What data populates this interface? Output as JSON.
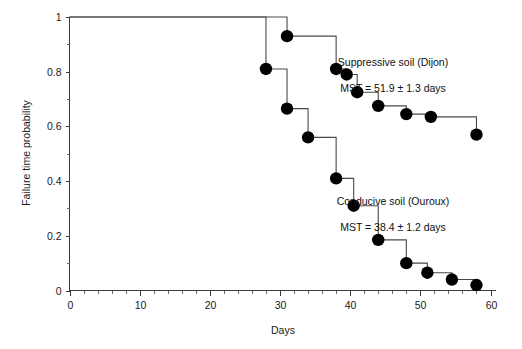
{
  "chart_data": {
    "type": "line",
    "title": "",
    "xlabel": "Days",
    "ylabel": "Failure time probability",
    "xlim": [
      0,
      60
    ],
    "ylim": [
      0,
      1
    ],
    "grid": false,
    "legend_position": "inside-right-annotations",
    "x_ticks": [
      0,
      10,
      20,
      30,
      40,
      50,
      60
    ],
    "x_tick_labels": [
      "0",
      "10",
      "20",
      "30",
      "40",
      "50",
      "60"
    ],
    "x_minor_step": 2,
    "y_ticks": [
      0,
      0.2,
      0.4,
      0.6,
      0.8,
      1
    ],
    "y_tick_labels": [
      "0",
      "0.2",
      "0.4",
      "0.6",
      "0.8",
      "1"
    ],
    "y_minor_ticks": [
      0.1,
      0.3,
      0.5,
      0.7,
      0.9
    ],
    "series": [
      {
        "name": "Suppressive soil (Dijon)",
        "style": "step",
        "marker": "filled-circle",
        "x": [
          0,
          31,
          38,
          39.5,
          41,
          44,
          48,
          51.5,
          58
        ],
        "y": [
          1,
          0.93,
          0.81,
          0.79,
          0.725,
          0.675,
          0.645,
          0.635,
          0.57
        ],
        "marker_x": [
          31,
          38,
          39.5,
          41,
          44,
          48,
          51.5,
          58
        ],
        "marker_y": [
          0.93,
          0.81,
          0.79,
          0.725,
          0.675,
          0.645,
          0.635,
          0.57
        ]
      },
      {
        "name": "Conducive soil (Ouroux)",
        "style": "step",
        "marker": "filled-circle",
        "x": [
          0,
          28,
          31,
          34,
          38,
          40.5,
          44,
          48,
          51,
          54.5,
          58
        ],
        "y": [
          1,
          0.81,
          0.665,
          0.56,
          0.41,
          0.31,
          0.185,
          0.1,
          0.065,
          0.04,
          0.02
        ],
        "marker_x": [
          28,
          31,
          34,
          38,
          40.5,
          44,
          48,
          51,
          54.5,
          58
        ],
        "marker_y": [
          0.81,
          0.665,
          0.56,
          0.41,
          0.31,
          0.185,
          0.1,
          0.065,
          0.04,
          0.02
        ]
      }
    ],
    "annotations": [
      {
        "id": "suppressive",
        "line1": "Suppressive soil (Dijon)",
        "line2": "MST = 51.9 ± 1.3 days",
        "mst_value": 51.9,
        "mst_error": 1.3,
        "mst_units": "days"
      },
      {
        "id": "conducive",
        "line1": "Conducive soil (Ouroux)",
        "line2": "MST = 38.4 ± 1.2 days",
        "mst_value": 38.4,
        "mst_error": 1.2,
        "mst_units": "days"
      }
    ],
    "colors": {
      "marker": "#000000",
      "line": "#4a4a4a",
      "axis": "#3a3a3a",
      "text": "#111111",
      "background": "#ffffff"
    }
  }
}
